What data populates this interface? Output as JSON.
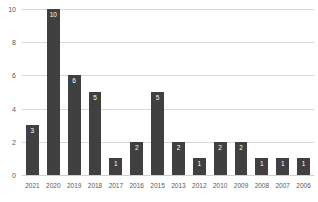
{
  "chart_data": {
    "type": "bar",
    "title": "",
    "subtitle": "",
    "xlabel": "",
    "ylabel": "",
    "categories": [
      "2021",
      "2020",
      "2019",
      "2018",
      "2017",
      "2016",
      "2015",
      "2013",
      "2012",
      "2010",
      "2009",
      "2008",
      "2007",
      "2006"
    ],
    "values": [
      3,
      10,
      6,
      5,
      1,
      2,
      5,
      2,
      1,
      2,
      2,
      1,
      1,
      1
    ],
    "data_labels": [
      "3",
      "10",
      "6",
      "5",
      "1",
      "2",
      "5",
      "2",
      "1",
      "2",
      "2",
      "1",
      "1",
      "1"
    ],
    "ylim": [
      0,
      10
    ],
    "y_ticks": [
      "0",
      "2",
      "4",
      "6",
      "8",
      "10"
    ],
    "y_tick_values": [
      0,
      2,
      4,
      6,
      8,
      10
    ],
    "grid": true,
    "grid_axis": "y",
    "legend": false,
    "legend_position": "none",
    "colors": {
      "bar": "#404040",
      "gridline": "#d9d9d9",
      "baseline": "#d0d0d0",
      "tick_label": "#595959",
      "data_label": "#ffffff",
      "background": "#ffffff"
    }
  }
}
